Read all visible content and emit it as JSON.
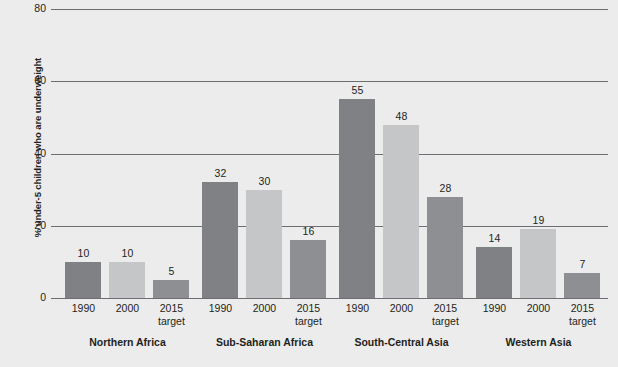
{
  "chart_data": {
    "type": "bar",
    "title": "",
    "xlabel": "",
    "ylabel": "% under-5 children who are underweight",
    "ylim": [
      0,
      80
    ],
    "yticks": [
      0,
      20,
      40,
      60,
      80
    ],
    "grid": true,
    "legend_position": "none",
    "categories": [
      "Northern Africa",
      "Sub-Saharan Africa",
      "South-Central Asia",
      "Western Asia"
    ],
    "subcategories": [
      "1990",
      "2000",
      "2015 target"
    ],
    "series": [
      {
        "name": "1990",
        "color": "#808184",
        "values": [
          10,
          32,
          55,
          14
        ]
      },
      {
        "name": "2000",
        "color": "#c5c6c8",
        "values": [
          10,
          30,
          48,
          19
        ]
      },
      {
        "name": "2015 target",
        "color": "#8e8f92",
        "values": [
          5,
          16,
          28,
          7
        ]
      }
    ]
  },
  "axis": {
    "y_title": "% under-5 children who are underweight",
    "tick_labels": [
      "80",
      "60",
      "40",
      "20",
      "0"
    ]
  },
  "groups": [
    {
      "label": "Northern Africa",
      "bars": [
        {
          "tick_line1": "1990",
          "tick_line2": "",
          "value": "10"
        },
        {
          "tick_line1": "2000",
          "tick_line2": "",
          "value": "10"
        },
        {
          "tick_line1": "2015",
          "tick_line2": "target",
          "value": "5"
        }
      ]
    },
    {
      "label": "Sub-Saharan Africa",
      "bars": [
        {
          "tick_line1": "1990",
          "tick_line2": "",
          "value": "32"
        },
        {
          "tick_line1": "2000",
          "tick_line2": "",
          "value": "30"
        },
        {
          "tick_line1": "2015",
          "tick_line2": "target",
          "value": "16"
        }
      ]
    },
    {
      "label": "South-Central Asia",
      "bars": [
        {
          "tick_line1": "1990",
          "tick_line2": "",
          "value": "55"
        },
        {
          "tick_line1": "2000",
          "tick_line2": "",
          "value": "48"
        },
        {
          "tick_line1": "2015",
          "tick_line2": "target",
          "value": "28"
        }
      ]
    },
    {
      "label": "Western Asia",
      "bars": [
        {
          "tick_line1": "1990",
          "tick_line2": "",
          "value": "14"
        },
        {
          "tick_line1": "2000",
          "tick_line2": "",
          "value": "19"
        },
        {
          "tick_line1": "2015",
          "tick_line2": "target",
          "value": "7"
        }
      ]
    }
  ],
  "colors": {
    "background": "#ececec",
    "axis": "#6d6e71",
    "text": "#231f20",
    "bar_1990": "#808184",
    "bar_2000": "#c5c6c8",
    "bar_2015": "#8e8f92"
  }
}
